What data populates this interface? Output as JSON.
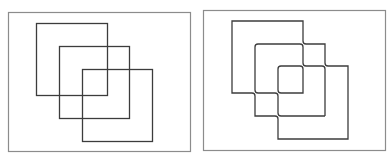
{
  "colors": {
    "background": "#ffffff",
    "frame_stroke": "#8c8c8c",
    "shape_stroke": "#3c3c3c"
  },
  "panels": [
    {
      "id": "left",
      "description": "Three overlapping squares drawn as plain crossing outlines",
      "frame": {
        "x": 8,
        "y": 12,
        "w": 182,
        "h": 139
      },
      "squares": [
        {
          "x": 36,
          "y": 23,
          "w": 71,
          "h": 72
        },
        {
          "x": 59,
          "y": 46,
          "w": 70,
          "h": 72
        },
        {
          "x": 82,
          "y": 69,
          "w": 70,
          "h": 72
        }
      ],
      "crossing_style": "plain"
    },
    {
      "id": "right",
      "description": "Same three overlapping squares with bridged (curved-gap) crossings",
      "frame": {
        "x": 203,
        "y": 10,
        "w": 182,
        "h": 140
      },
      "squares": [
        {
          "x": 232,
          "y": 21,
          "w": 71,
          "h": 72
        },
        {
          "x": 255,
          "y": 44,
          "w": 70,
          "h": 72
        },
        {
          "x": 278,
          "y": 66,
          "w": 70,
          "h": 73
        }
      ],
      "crossing_style": "bridged"
    }
  ]
}
